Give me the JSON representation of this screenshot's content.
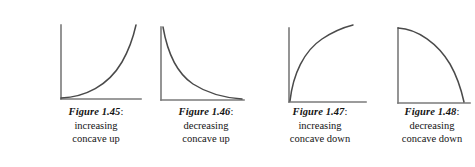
{
  "page": {
    "background_color": "#ffffff",
    "axis_color": "#7a7a7a",
    "curve_color": "#4a4a4a",
    "text_color": "#141414"
  },
  "figures": [
    {
      "label": "Figure 1.45",
      "colon": ":",
      "desc_line1": "increasing",
      "desc_line2": "concave up",
      "curve_name": "increasing-concave-up",
      "curve_path": "M 21 82 C 45 81 68 70 82 46 C 90 32 94 18 96 9",
      "x_axis_path": "M 21 83 L 101 83",
      "y_axis_path": "M 21 9 L 21 83"
    },
    {
      "label": "Figure 1.46",
      "colon": ":",
      "desc_line1": "decreasing",
      "desc_line2": "concave up",
      "curve_name": "decreasing-concave-up",
      "curve_path": "M 13 11 C 17 34 25 56 43 68 C 60 79 78 82 92 83",
      "x_axis_path": "M 11 84 L 94 84",
      "y_axis_path": "M 11 11 L 11 84"
    },
    {
      "label": "Figure 1.47",
      "colon": ":",
      "desc_line1": "increasing",
      "desc_line2": "concave down",
      "curve_name": "increasing-concave-down",
      "curve_path": "M 26 85 C 29 58 40 35 58 23 C 70 15 81 11 89 9",
      "x_axis_path": "M 25 86 L 102 86",
      "y_axis_path": "M 25 12 L 25 86"
    },
    {
      "label": "Figure 1.48",
      "colon": ":",
      "desc_line1": "decreasing",
      "desc_line2": "concave down",
      "curve_name": "decreasing-concave-down",
      "curve_path": "M 22 12 C 42 13 62 28 74 48 C 82 62 86 77 88 86",
      "x_axis_path": "M 22 87 L 94 87",
      "y_axis_path": "M 22 12 L 22 87"
    }
  ]
}
